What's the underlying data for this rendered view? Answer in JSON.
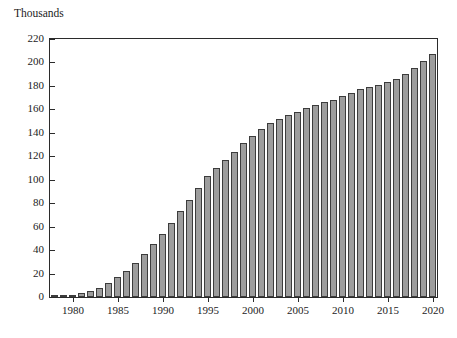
{
  "figure": {
    "unit_title": "Thousands"
  },
  "chart_data": {
    "type": "bar",
    "title": "Thousands",
    "xlabel": "",
    "ylabel": "Thousands",
    "ylim": [
      0,
      220
    ],
    "xlim": [
      1977.5,
      2020.5
    ],
    "grid": false,
    "legend": null,
    "y_ticks": [
      0,
      20,
      40,
      60,
      80,
      100,
      120,
      140,
      160,
      180,
      200,
      220
    ],
    "y_tick_labels": [
      "0",
      "20",
      "40",
      "60",
      "80",
      "100",
      "120",
      "140",
      "160",
      "180",
      "200",
      "220"
    ],
    "x_ticks": [
      1980,
      1985,
      1990,
      1995,
      2000,
      2005,
      2010,
      2015,
      2020
    ],
    "x_tick_labels": [
      "1980",
      "1985",
      "1990",
      "1995",
      "2000",
      "2005",
      "2010",
      "2015",
      "2020"
    ],
    "bar_color": "#9d9d9d",
    "bar_edge_color": "#3c3c3c",
    "categories": [
      "1978",
      "1979",
      "1980",
      "1981",
      "1982",
      "1983",
      "1984",
      "1985",
      "1986",
      "1987",
      "1988",
      "1989",
      "1990",
      "1991",
      "1992",
      "1993",
      "1994",
      "1995",
      "1996",
      "1997",
      "1998",
      "1999",
      "2000",
      "2001",
      "2002",
      "2003",
      "2004",
      "2005",
      "2006",
      "2007",
      "2008",
      "2009",
      "2010",
      "2011",
      "2012",
      "2013",
      "2014",
      "2015",
      "2016",
      "2017",
      "2018",
      "2019",
      "2020"
    ],
    "values": [
      1,
      1,
      2,
      3,
      5,
      8,
      12,
      17,
      22,
      29,
      37,
      45,
      54,
      63,
      73,
      83,
      93,
      103,
      110,
      117,
      124,
      131,
      137,
      143,
      148,
      152,
      155,
      158,
      161,
      164,
      166,
      168,
      171,
      174,
      177,
      179,
      181,
      183,
      186,
      190,
      195,
      201,
      207
    ]
  }
}
